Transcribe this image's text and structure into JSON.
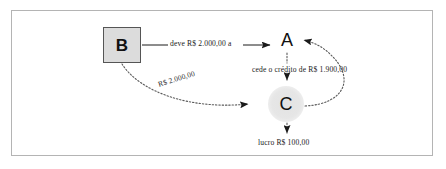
{
  "diagram": {
    "type": "flow-diagram",
    "nodes": [
      {
        "id": "B",
        "label": "B",
        "shape": "square",
        "fill": "#dcdcdc",
        "stroke": "#555555"
      },
      {
        "id": "A",
        "label": "A",
        "shape": "text",
        "fill": "none",
        "stroke": "none"
      },
      {
        "id": "C",
        "label": "C",
        "shape": "circle",
        "fill": "#e6e6e6",
        "stroke": "none"
      }
    ],
    "edges": [
      {
        "from": "B",
        "to": "A",
        "label": "deve R$ 2.000,00 a",
        "style": "solid",
        "arrow": "end"
      },
      {
        "from": "A",
        "to": "C",
        "label": "cede o crédito de R$ 1.900,00",
        "style": "dotted",
        "arrow": "end"
      },
      {
        "from": "B",
        "to": "C",
        "label": "R$ 2.000,00",
        "style": "dotted",
        "arrow": "end"
      },
      {
        "from": "C",
        "to": "A",
        "label": "",
        "style": "dotted",
        "arrow": "end"
      },
      {
        "from": "C",
        "to": "out",
        "label": "lucro R$ 100,00",
        "style": "dotted",
        "arrow": "end"
      }
    ],
    "labels": {
      "deve": "deve R$ 2.000,00 a",
      "cede": "cede o crédito de R$ 1.900,00",
      "rs2000": "R$ 2.000,00",
      "lucro": "lucro R$ 100,00"
    },
    "colors": {
      "frame": "#b4b4b4",
      "line": "#1a1a1a",
      "dotted": "#6b6b6b",
      "background": "#ffffff",
      "text": "#1a1a1a"
    }
  }
}
